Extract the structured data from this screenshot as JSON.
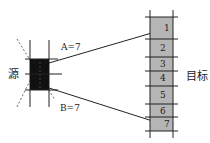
{
  "diagram": {
    "source_label": "源",
    "target_label": "目标",
    "angle_a_label": "A=7",
    "angle_b_label": "B=7",
    "target_cells": [
      "1",
      "2",
      "3",
      "4",
      "5",
      "6",
      "7"
    ],
    "colors": {
      "source_fill": "#111111",
      "target_fill": "#b5b5b5",
      "line": "#222222"
    }
  }
}
